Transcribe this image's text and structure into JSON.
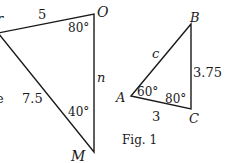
{
  "figure": {
    "caption": "Fig. 1",
    "line_color": "#1a1a1a",
    "left_triangle": {
      "vertices": {
        "top_left": {
          "label": "N",
          "x": -2,
          "y": 33
        },
        "O": {
          "label": "O",
          "x": 94,
          "y": 14
        },
        "M": {
          "label": "M",
          "x": 94,
          "y": 152
        }
      },
      "labels": {
        "side_top": "5",
        "side_left": "7.5",
        "side_right": "n",
        "angle_O": "80°",
        "angle_M": "40°",
        "vertex_O": "O",
        "vertex_M": "M",
        "partial_left_text": "e",
        "partial_top_text": "r"
      }
    },
    "right_triangle": {
      "vertices": {
        "A": {
          "label": "A",
          "x": 131,
          "y": 96
        },
        "B": {
          "label": "B",
          "x": 191,
          "y": 24
        },
        "C": {
          "label": "C",
          "x": 191,
          "y": 109
        }
      },
      "labels": {
        "side_AB": "c",
        "side_BC": "3.75",
        "side_AC": "3",
        "angle_A": "60°",
        "angle_C": "80°",
        "vertex_A": "A",
        "vertex_B": "B",
        "vertex_C": "C"
      }
    }
  }
}
